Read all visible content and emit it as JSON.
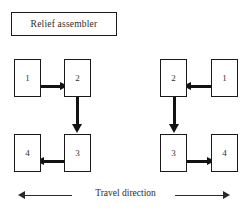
{
  "figure": {
    "title_box": {
      "label": "Relief assembler"
    },
    "groups": [
      {
        "id": "left-group",
        "orientation": "counterclockwise",
        "nodes": [
          {
            "id": "left-node-1",
            "label": "1",
            "x": 14,
            "y": 59
          },
          {
            "id": "left-node-2",
            "label": "2",
            "x": 64,
            "y": 59
          },
          {
            "id": "left-node-3",
            "label": "3",
            "x": 64,
            "y": 134
          },
          {
            "id": "left-node-4",
            "label": "4",
            "x": 14,
            "y": 134
          }
        ],
        "connectors": [
          {
            "id": "left-arrow-1-to-2",
            "direction": "right",
            "from": "1",
            "to": "2",
            "x": 36,
            "y": 83,
            "length": 32
          },
          {
            "id": "left-arrow-2-to-3",
            "direction": "down",
            "from": "2",
            "to": "3",
            "x": 74,
            "y": 99,
            "length": 33
          },
          {
            "id": "left-arrow-3-to-4",
            "direction": "left",
            "from": "3",
            "to": "4",
            "x": 36,
            "y": 158,
            "length": 32
          }
        ]
      },
      {
        "id": "right-group",
        "orientation": "clockwise",
        "nodes": [
          {
            "id": "right-node-1",
            "label": "1",
            "x": 211,
            "y": 59
          },
          {
            "id": "right-node-2",
            "label": "2",
            "x": 160,
            "y": 59
          },
          {
            "id": "right-node-3",
            "label": "3",
            "x": 160,
            "y": 134
          },
          {
            "id": "right-node-4",
            "label": "4",
            "x": 211,
            "y": 134
          }
        ],
        "connectors": [
          {
            "id": "right-arrow-1-to-2",
            "direction": "left",
            "from": "1",
            "to": "2",
            "x": 183,
            "y": 83,
            "length": 32
          },
          {
            "id": "right-arrow-2-to-3",
            "direction": "down",
            "from": "2",
            "to": "3",
            "x": 171,
            "y": 99,
            "length": 33
          },
          {
            "id": "right-arrow-3-to-4",
            "direction": "right",
            "from": "3",
            "to": "4",
            "x": 183,
            "y": 158,
            "length": 32
          }
        ]
      }
    ],
    "travel_direction": {
      "label": "Travel direction",
      "left_arrow": {
        "id": "travel-arrow-left",
        "direction": "left",
        "x": 18,
        "y": 191,
        "length": 54
      },
      "right_arrow": {
        "id": "travel-arrow-right",
        "direction": "right",
        "x": 175,
        "y": 191,
        "length": 55
      }
    },
    "colors": {
      "stroke": "#1a1a1a",
      "arrow_fill": "#121212",
      "text": "#2b2b2b",
      "background": "#ffffff"
    }
  }
}
